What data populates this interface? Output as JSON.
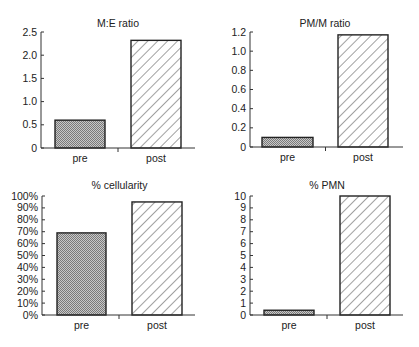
{
  "chart_data": [
    {
      "type": "bar",
      "title": "M:E ratio",
      "categories": [
        "pre",
        "post"
      ],
      "values": [
        0.6,
        2.32
      ],
      "xlabel": "",
      "ylabel": "",
      "ylim": [
        0,
        2.5
      ],
      "yticks": [
        0,
        0.5,
        1.0,
        1.5,
        2.0,
        2.5
      ],
      "ytick_labels": [
        "0",
        "0.5",
        "1.0",
        "1.5",
        "2.0",
        "2.5"
      ],
      "grid": false,
      "legend": null,
      "bar_styles": [
        "stipple-gray",
        "diagonal-hatch"
      ]
    },
    {
      "type": "bar",
      "title": "PM/M ratio",
      "categories": [
        "pre",
        "post"
      ],
      "values": [
        0.1,
        1.17
      ],
      "xlabel": "",
      "ylabel": "",
      "ylim": [
        0,
        1.2
      ],
      "yticks": [
        0,
        0.2,
        0.4,
        0.6,
        0.8,
        1.0,
        1.2
      ],
      "ytick_labels": [
        "0",
        "0.2",
        "0.4",
        "0.6",
        "0.8",
        "1.0",
        "1.2"
      ],
      "grid": false,
      "legend": null,
      "bar_styles": [
        "stipple-gray",
        "diagonal-hatch"
      ]
    },
    {
      "type": "bar",
      "title": "% cellularity",
      "categories": [
        "pre",
        "post"
      ],
      "values": [
        69,
        95
      ],
      "xlabel": "",
      "ylabel": "",
      "ylim": [
        0,
        100
      ],
      "yticks": [
        0,
        10,
        20,
        30,
        40,
        50,
        60,
        70,
        80,
        90,
        100
      ],
      "ytick_labels": [
        "0%",
        "10%",
        "20%",
        "30%",
        "40%",
        "50%",
        "60%",
        "70%",
        "80%",
        "90%",
        "100%"
      ],
      "grid": false,
      "legend": null,
      "bar_styles": [
        "stipple-gray",
        "diagonal-hatch"
      ]
    },
    {
      "type": "bar",
      "title": "% PMN",
      "categories": [
        "pre",
        "post"
      ],
      "values": [
        0.4,
        10
      ],
      "xlabel": "",
      "ylabel": "",
      "ylim": [
        0,
        10
      ],
      "yticks": [
        0,
        1,
        2,
        3,
        4,
        5,
        6,
        7,
        8,
        9,
        10
      ],
      "ytick_labels": [
        "0",
        "1",
        "2",
        "3",
        "4",
        "5",
        "6",
        "7",
        "8",
        "9",
        "10"
      ],
      "grid": false,
      "legend": null,
      "bar_styles": [
        "stipple-gray",
        "diagonal-hatch"
      ]
    }
  ],
  "colors": {
    "axis": "#333333",
    "bar_outline": "#222222",
    "stipple_fg": "#7a7a7a",
    "stipple_bg": "#c8c8c8",
    "hatch_line": "#444444",
    "background": "#ffffff"
  }
}
